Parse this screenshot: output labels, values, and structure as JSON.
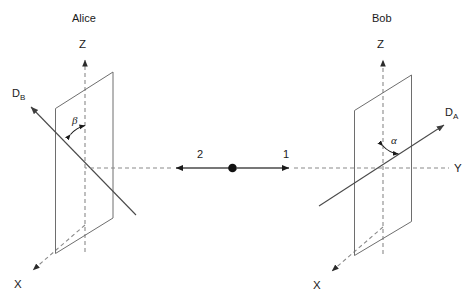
{
  "figure": {
    "title": "",
    "background_color": "#ffffff",
    "width": 473,
    "height": 303
  },
  "stations": {
    "left": {
      "name": "Alice",
      "axes": {
        "z_label": "Z",
        "x_label": "X"
      },
      "detector": {
        "label": "D",
        "subscript": "B"
      },
      "angle": {
        "symbol": "β",
        "between": "Z axis and D_B detector axis"
      },
      "particle": {
        "label": "2",
        "direction": "left"
      }
    },
    "right": {
      "name": "Bob",
      "axes": {
        "z_label": "Z",
        "x_label": "X",
        "y_label": "Y"
      },
      "detector": {
        "label": "D",
        "subscript": "A"
      },
      "angle": {
        "symbol": "α",
        "between": "Z axis and D_A detector axis"
      },
      "particle": {
        "label": "1",
        "direction": "right"
      }
    }
  },
  "source": {
    "name": "particle-source",
    "shape": "filled-dot"
  },
  "colors": {
    "stroke_dark": "#1a1a1a",
    "stroke_line": "#4a4a4a",
    "plane_edge": "#6e6e6e",
    "axis_dashed": "#8a8a8a",
    "background": "#ffffff"
  }
}
